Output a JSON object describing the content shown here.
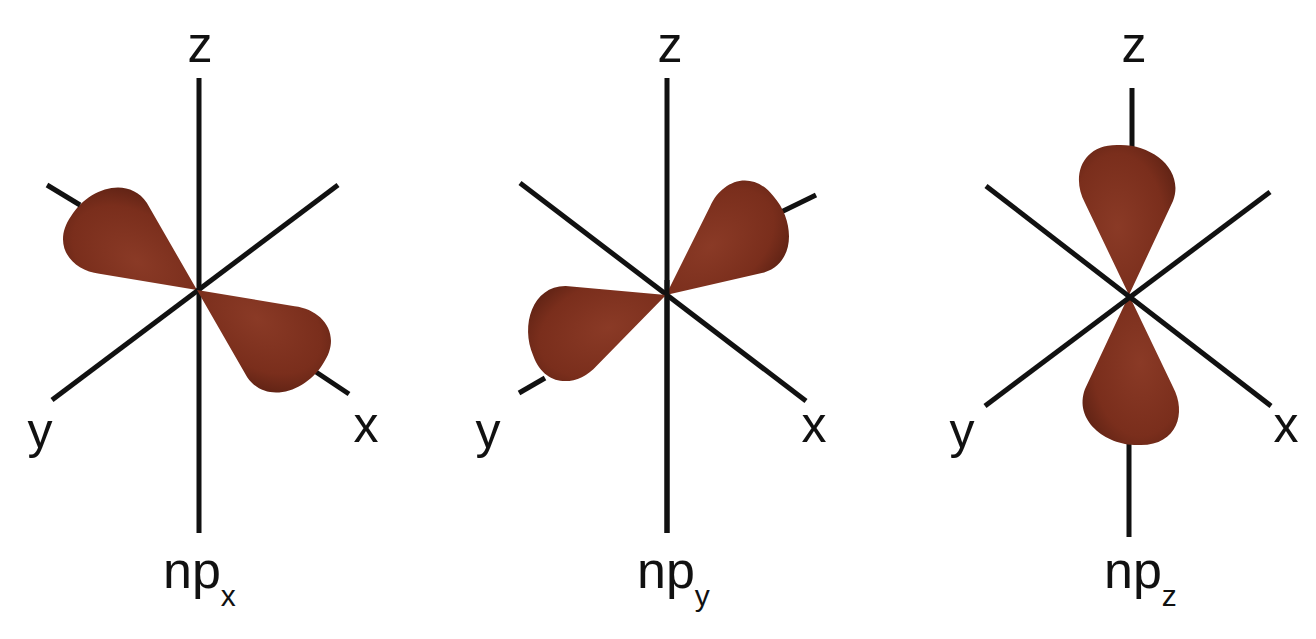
{
  "diagram": {
    "lobe_color": "#7a2e1c",
    "axis_color": "#111111",
    "panels": [
      {
        "id": "px",
        "label_main": "np",
        "label_sub": "x",
        "axes": {
          "z": "z",
          "y": "y",
          "x": "x"
        },
        "lobe_axis": "x"
      },
      {
        "id": "py",
        "label_main": "np",
        "label_sub": "y",
        "axes": {
          "z": "z",
          "y": "y",
          "x": "x"
        },
        "lobe_axis": "y"
      },
      {
        "id": "pz",
        "label_main": "np",
        "label_sub": "z",
        "axes": {
          "z": "z",
          "y": "y",
          "x": "x"
        },
        "lobe_axis": "z"
      }
    ]
  }
}
